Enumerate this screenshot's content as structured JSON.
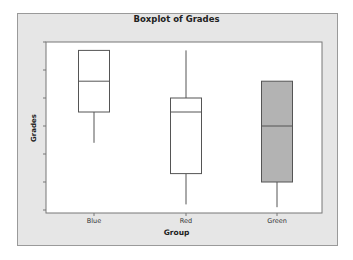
{
  "chart_data": {
    "type": "boxplot",
    "title": "Boxplot of Grades",
    "xlabel": "Group",
    "ylabel": "Grades",
    "categories": [
      "Blue",
      "Red",
      "Green"
    ],
    "y_ticks_count": 7,
    "y_tick_labels": [],
    "ylim": [
      0,
      6
    ],
    "grid": false,
    "legend": null,
    "series": [
      {
        "name": "Blue",
        "min": 2.4,
        "q1": 3.5,
        "median": 4.6,
        "q3": 5.7,
        "max": 5.7,
        "fill": "#ffffff"
      },
      {
        "name": "Red",
        "min": 0.2,
        "q1": 1.3,
        "median": 3.5,
        "q3": 4.0,
        "max": 5.7,
        "fill": "#ffffff"
      },
      {
        "name": "Green",
        "min": 0.1,
        "q1": 1.0,
        "median": 3.0,
        "q3": 4.6,
        "max": 4.6,
        "fill": "#b3b3b3"
      }
    ],
    "note": "Y-axis has tick marks but no numeric labels; values are in tick units (0 = bottom tick, 6 = top tick)."
  },
  "colors": {
    "frame_bg": "#e6e6e6",
    "plot_bg": "#ffffff",
    "box_stroke": "#555555",
    "green_fill": "#b3b3b3"
  }
}
